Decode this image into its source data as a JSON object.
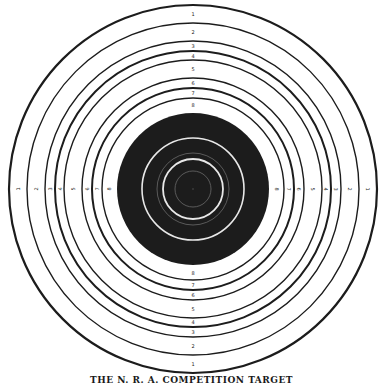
{
  "target": {
    "center": {
      "x": 193,
      "y": 189
    },
    "colors": {
      "ink": "#1c1c1c",
      "paper": "#ffffff",
      "bull_rings": "#e8e8e8",
      "bull_faint": "#6a6a6a"
    },
    "outer_rings": [
      {
        "r": 184,
        "w": 2.2
      },
      {
        "r": 166,
        "w": 1.4
      },
      {
        "r": 148,
        "w": 1.4
      },
      {
        "r": 138,
        "w": 2.0
      },
      {
        "r": 129,
        "w": 1.4
      },
      {
        "r": 111,
        "w": 1.4
      },
      {
        "r": 101,
        "w": 2.0
      },
      {
        "r": 91,
        "w": 1.4
      }
    ],
    "black_radius": 76,
    "bull_rings": [
      {
        "r": 51,
        "w": 1.6,
        "faint": false
      },
      {
        "r": 36,
        "w": 0.8,
        "faint": true
      },
      {
        "r": 30,
        "w": 1.8,
        "faint": false
      },
      {
        "r": 18,
        "w": 0.8,
        "faint": true
      }
    ],
    "score_labels": [
      "1",
      "2",
      "3",
      "4",
      "5",
      "6",
      "7",
      "8"
    ],
    "label_radii": [
      175,
      157,
      143,
      133,
      120,
      106,
      96,
      84
    ]
  },
  "caption": "THE N. R. A. COMPETITION TARGET"
}
